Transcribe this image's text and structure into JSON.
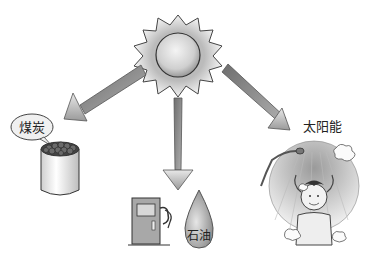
{
  "diagram": {
    "title": "",
    "center": {
      "name": "sun",
      "icon": "sun-icon"
    },
    "branches": [
      {
        "target": "coal",
        "label": "煤炭",
        "icon": "coal-bucket-icon"
      },
      {
        "target": "oil",
        "label": "石油",
        "icon": "oil-drop-icon",
        "extra_icon": "fuel-pump-icon"
      },
      {
        "target": "solar",
        "label": "太阳能",
        "icon": "solar-shower-icon"
      }
    ]
  },
  "colors": {
    "arrow": "#8a8a8a",
    "outline": "#333333",
    "background": "#ffffff"
  }
}
